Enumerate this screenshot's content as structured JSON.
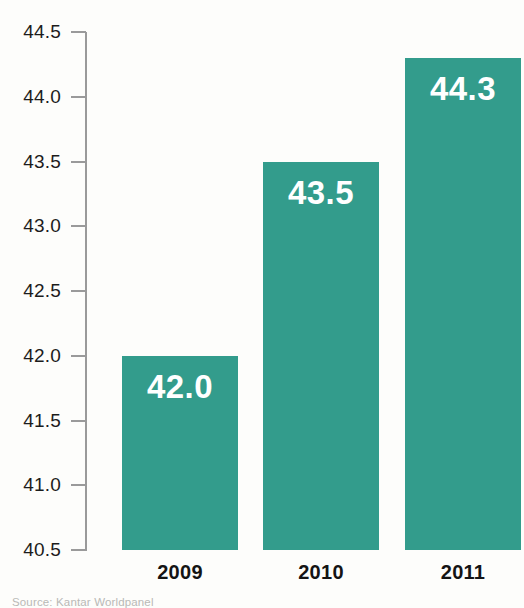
{
  "chart_data": {
    "type": "bar",
    "title": "",
    "subtitle": "",
    "xlabel": "",
    "ylabel": "",
    "categories": [
      "2009",
      "2010",
      "2011"
    ],
    "values": [
      42.0,
      43.5,
      44.3
    ],
    "value_labels": [
      "42.0",
      "43.5",
      "44.3"
    ],
    "ylim": [
      40.5,
      44.5
    ],
    "ytick_step": 0.5,
    "ytick_labels": [
      "44.5",
      "44.0",
      "43.5",
      "43.0",
      "42.5",
      "42.0",
      "41.5",
      "41.0",
      "40.5"
    ],
    "ytick_values": [
      44.5,
      44.0,
      43.5,
      43.0,
      42.5,
      42.0,
      41.5,
      41.0,
      40.5
    ],
    "grid": false,
    "legend": null,
    "series": [
      {
        "name": "",
        "values": [
          42.0,
          43.5,
          44.3
        ]
      }
    ],
    "colors": {
      "bar": "#339c8c",
      "value_label": "#ffffff",
      "axis": "#9a9a9a",
      "tick_text": "#1c1c1c",
      "category_text": "#141414",
      "background": "#fdfdfb",
      "source_text": "#b9b9b6"
    }
  },
  "footer": {
    "source": "Source: Kantar Worldpanel"
  }
}
